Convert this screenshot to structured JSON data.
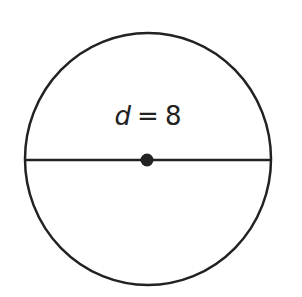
{
  "diagram": {
    "shape": "circle",
    "label": {
      "variable": "d",
      "equals": "=",
      "value": "8"
    },
    "elements": [
      "circle-outline",
      "diameter-line",
      "center-point"
    ],
    "colors": {
      "stroke": "#222222",
      "background": "#ffffff"
    }
  }
}
